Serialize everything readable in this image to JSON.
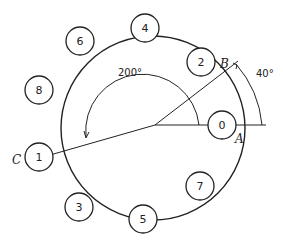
{
  "diagram": {
    "nodes": [
      {
        "id": "0",
        "label": "0"
      },
      {
        "id": "2",
        "label": "2"
      },
      {
        "id": "4",
        "label": "4"
      },
      {
        "id": "6",
        "label": "6"
      },
      {
        "id": "8",
        "label": "8"
      },
      {
        "id": "1",
        "label": "1"
      },
      {
        "id": "3",
        "label": "3"
      },
      {
        "id": "5",
        "label": "5"
      },
      {
        "id": "7",
        "label": "7"
      }
    ],
    "points": {
      "A": "A",
      "B": "B",
      "C": "C"
    },
    "angles": {
      "large": "200°",
      "small": "40°"
    }
  }
}
